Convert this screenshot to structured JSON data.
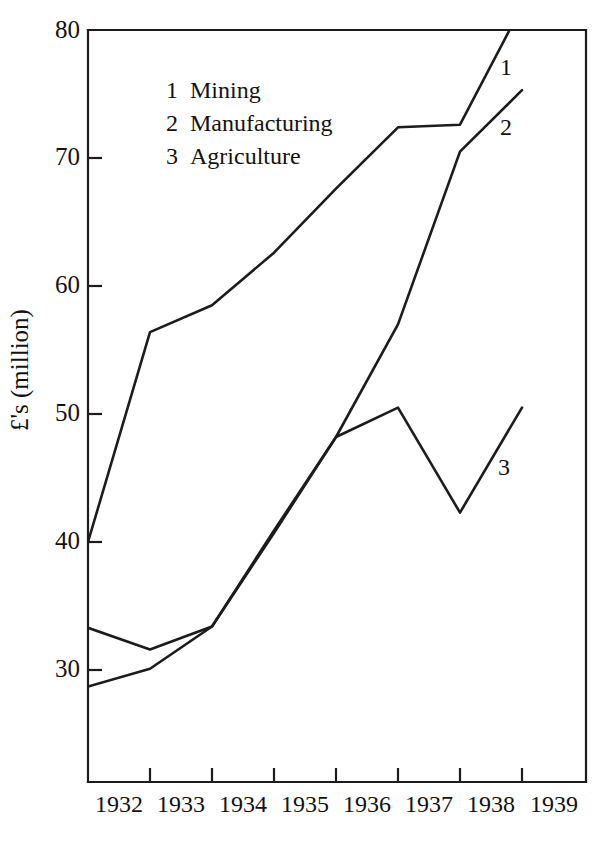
{
  "chart_data": {
    "type": "line",
    "title": "",
    "subtitle": "",
    "xlabel": "",
    "ylabel": "£'s (million)",
    "x": [
      1932,
      1933,
      1934,
      1935,
      1936,
      1937,
      1938,
      1939
    ],
    "xtick_labels": [
      "1932",
      "1933",
      "1934",
      "1935",
      "1936",
      "1937",
      "1938",
      "1939"
    ],
    "ytick_labels": [
      "30",
      "40",
      "50",
      "60",
      "70",
      "80"
    ],
    "ytick_values": [
      30,
      40,
      50,
      60,
      70,
      80
    ],
    "ylim": [
      23.2,
      80
    ],
    "xlim": [
      1931.5,
      1939.5
    ],
    "grid": false,
    "legend_position": "upper-left-inside",
    "series": [
      {
        "key": "1",
        "name": "Mining",
        "legend_label": "1  Mining",
        "end_label": "1",
        "x": [
          1931.5,
          1932.5,
          1933.5,
          1934.5,
          1935.5,
          1936.5,
          1937.5,
          1938.3
        ],
        "values": [
          40.0,
          56.4,
          58.5,
          62.6,
          67.6,
          72.4,
          72.6,
          80.0
        ],
        "color": "#1c1c1c"
      },
      {
        "key": "2",
        "name": "Manufacturing",
        "legend_label": "2  Manufacturing",
        "end_label": "2",
        "x": [
          1931.5,
          1932.5,
          1933.5,
          1934.5,
          1935.5,
          1936.5,
          1937.5,
          1938.5
        ],
        "values": [
          33.3,
          31.6,
          33.4,
          40.7,
          48.2,
          57.0,
          70.5,
          75.3
        ],
        "color": "#1c1c1c"
      },
      {
        "key": "3",
        "name": "Agriculture",
        "legend_label": "3  Agriculture",
        "end_label": "3",
        "x": [
          1931.5,
          1932.5,
          1933.5,
          1934.5,
          1935.5,
          1936.5,
          1937.5,
          1938.5
        ],
        "values": [
          28.7,
          30.1,
          33.4,
          40.9,
          48.2,
          50.5,
          42.3,
          50.5
        ],
        "color": "#1c1c1c"
      }
    ],
    "legend": [
      {
        "num": "1",
        "label": "Mining"
      },
      {
        "num": "2",
        "label": "Manufacturing"
      },
      {
        "num": "3",
        "label": "Agriculture"
      }
    ],
    "annotations": [
      {
        "text": "1",
        "near": "mining-line-end"
      },
      {
        "text": "2",
        "near": "manufacturing-line-end"
      },
      {
        "text": "3",
        "near": "agriculture-line-end"
      }
    ]
  },
  "geometry": {
    "plot_left": 88,
    "plot_right": 586,
    "plot_top": 30,
    "plot_bottom": 782,
    "y_value_at_top": 80,
    "px_per_unit": 12.8,
    "x_px_per_year": 62,
    "x_px_at_1931_5": 88
  }
}
